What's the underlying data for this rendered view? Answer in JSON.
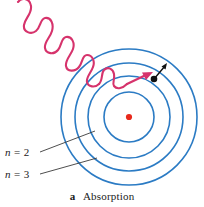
{
  "figure": {
    "title": "Absorption",
    "caption": {
      "letter": "a",
      "text": "Absorption"
    },
    "colors": {
      "orbit_blue": "#2b7bc4",
      "nucleus_red": "#e8291c",
      "photon_crimson": "#d6336c",
      "leader_line": "#3a3a3a",
      "electron_black": "#111111",
      "background": "#ffffff"
    },
    "labels": [
      {
        "id": "n2",
        "variable": "n",
        "equals": "=",
        "value": "2",
        "full": "n = 2"
      },
      {
        "id": "n3",
        "variable": "n",
        "equals": "=",
        "value": "3",
        "full": "n = 3"
      }
    ],
    "diagram": {
      "center": {
        "x": 129,
        "y": 117
      },
      "nucleus_radius": 3,
      "orbits": [
        {
          "level": 1,
          "radius": 25
        },
        {
          "level": 2,
          "radius": 41
        },
        {
          "level": 3,
          "radius": 54
        },
        {
          "level": 4,
          "radius": 68
        }
      ],
      "electron": {
        "x": 155,
        "y": 78
      },
      "photon": {
        "direction": "incoming",
        "path": "wavy-diagonal-from-upper-left"
      }
    }
  }
}
